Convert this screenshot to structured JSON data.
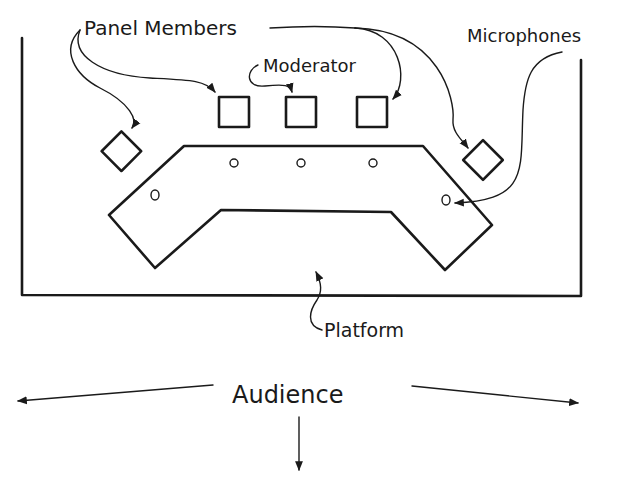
{
  "diagram": {
    "type": "panel-discussion-seating-layout",
    "labels": {
      "panel_members": "Panel Members",
      "moderator": "Moderator",
      "microphones": "Microphones",
      "platform": "Platform",
      "audience": "Audience"
    },
    "elements": {
      "chairs_count": 5,
      "microphones_count": 5,
      "table_shape": "bent-trapezoid",
      "audience_arrows": [
        "left",
        "down",
        "right"
      ]
    },
    "colors": {
      "ink": "#1a1a1a",
      "background": "#ffffff"
    }
  }
}
